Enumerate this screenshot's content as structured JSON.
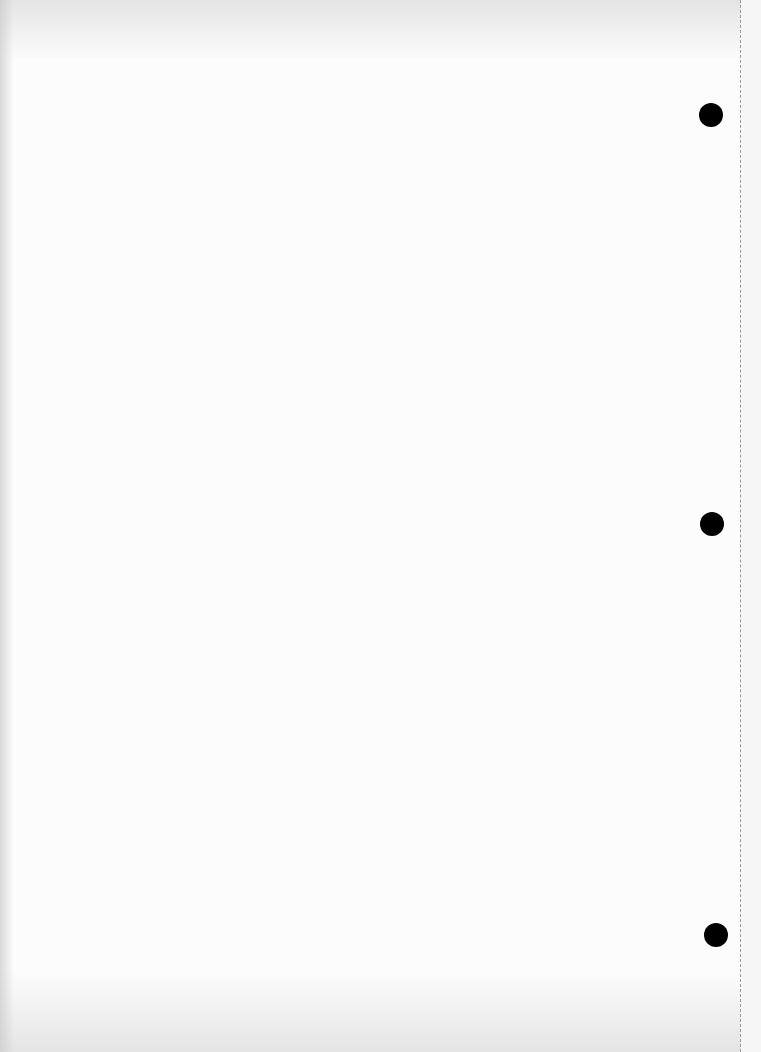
{
  "page": {
    "background_color": "#fcfcfc",
    "text": ""
  },
  "holes": [
    {
      "name": "punch-hole-top",
      "x": 699,
      "y": 103,
      "diameter": 24
    },
    {
      "name": "punch-hole-middle",
      "x": 700,
      "y": 512,
      "diameter": 24
    },
    {
      "name": "punch-hole-bottom",
      "x": 704,
      "y": 923,
      "diameter": 24
    }
  ],
  "perforation": {
    "x": 740,
    "color": "#9a9a9a"
  }
}
